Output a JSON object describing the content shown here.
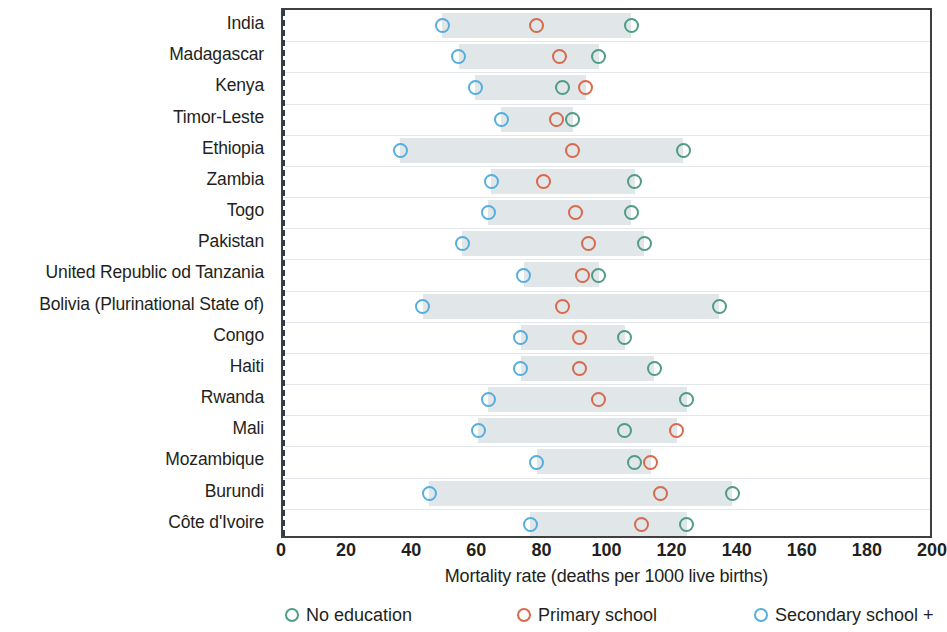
{
  "chart_data": {
    "type": "scatter",
    "title": "",
    "xlabel": "Mortality rate (deaths per 1000 live births)",
    "ylabel": "",
    "xlim": [
      0,
      200
    ],
    "xticks": [
      0,
      20,
      40,
      60,
      80,
      100,
      120,
      140,
      160,
      180,
      200
    ],
    "grid": true,
    "legend_position": "bottom",
    "orientation": "horizontal",
    "categories": [
      "India",
      "Madagascar",
      "Kenya",
      "Timor-Leste",
      "Ethiopia",
      "Zambia",
      "Togo",
      "Pakistan",
      "United Republic od Tanzania",
      "Bolivia (Plurinational State of)",
      "Congo",
      "Haiti",
      "Rwanda",
      "Mali",
      "Mozambique",
      "Burundi",
      "Côte d'Ivoire"
    ],
    "series": [
      {
        "name": "No education",
        "color": "#4f9d82",
        "values": [
          107,
          97,
          86,
          89,
          123,
          108,
          107,
          111,
          97,
          134,
          105,
          114,
          124,
          105,
          108,
          138,
          124
        ]
      },
      {
        "name": "Primary school",
        "color": "#d9694b",
        "values": [
          78,
          85,
          93,
          84,
          89,
          80,
          90,
          94,
          92,
          86,
          91,
          91,
          97,
          121,
          113,
          116,
          110
        ]
      },
      {
        "name": "Secondary school +",
        "color": "#56aede",
        "values": [
          49,
          54,
          59,
          67,
          36,
          64,
          63,
          55,
          74,
          43,
          73,
          73,
          63,
          60,
          78,
          45,
          76
        ]
      }
    ]
  },
  "legend": {
    "items": [
      {
        "label": "No education",
        "color": "#4f9d82",
        "icon": "circle-outline-icon"
      },
      {
        "label": "Primary school",
        "color": "#d9694b",
        "icon": "circle-outline-icon"
      },
      {
        "label": "Secondary school +",
        "color": "#56aede",
        "icon": "circle-outline-icon"
      }
    ]
  },
  "axis": {
    "x_title": "Mortality rate (deaths per 1000 live births)",
    "x_tick_labels": [
      "0",
      "20",
      "40",
      "60",
      "80",
      "100",
      "120",
      "140",
      "160",
      "180",
      "200"
    ]
  }
}
